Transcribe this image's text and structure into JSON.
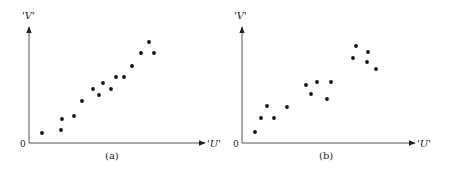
{
  "figure": {
    "panels": [
      {
        "caption": "(a)",
        "x_label": "'U'",
        "y_label": "'V'",
        "origin_label": "0"
      },
      {
        "caption": "(b)",
        "x_label": "'U'",
        "y_label": "'V'",
        "origin_label": "0"
      }
    ]
  },
  "chart_data": [
    {
      "type": "scatter",
      "title": "(a)",
      "xlabel": "'U'",
      "ylabel": "'V'",
      "origin_label": "0",
      "grid": false,
      "ticks": false,
      "description": "Strong linear positive correlation",
      "x_range_px": [
        29,
        205
      ],
      "y_range_px": [
        143,
        26
      ],
      "points": [
        {
          "x": 13,
          "y": 10
        },
        {
          "x": 32,
          "y": 13
        },
        {
          "x": 33,
          "y": 24
        },
        {
          "x": 45,
          "y": 27
        },
        {
          "x": 53,
          "y": 42
        },
        {
          "x": 64,
          "y": 54
        },
        {
          "x": 70,
          "y": 48
        },
        {
          "x": 74,
          "y": 60
        },
        {
          "x": 82,
          "y": 54
        },
        {
          "x": 87,
          "y": 66
        },
        {
          "x": 95,
          "y": 66
        },
        {
          "x": 103,
          "y": 77
        },
        {
          "x": 112,
          "y": 90
        },
        {
          "x": 120,
          "y": 101
        },
        {
          "x": 125,
          "y": 90
        }
      ]
    },
    {
      "type": "scatter",
      "title": "(b)",
      "xlabel": "'U'",
      "ylabel": "'V'",
      "origin_label": "0",
      "grid": false,
      "ticks": false,
      "description": "Positive association in three clusters",
      "x_range_px": [
        242,
        415
      ],
      "y_range_px": [
        143,
        26
      ],
      "points": [
        {
          "x": 13,
          "y": 11
        },
        {
          "x": 19,
          "y": 25
        },
        {
          "x": 25,
          "y": 37
        },
        {
          "x": 32,
          "y": 25
        },
        {
          "x": 45,
          "y": 36
        },
        {
          "x": 64,
          "y": 58
        },
        {
          "x": 69,
          "y": 49
        },
        {
          "x": 75,
          "y": 61
        },
        {
          "x": 85,
          "y": 44
        },
        {
          "x": 89,
          "y": 61
        },
        {
          "x": 111,
          "y": 85
        },
        {
          "x": 114,
          "y": 97
        },
        {
          "x": 125,
          "y": 81
        },
        {
          "x": 126,
          "y": 91
        },
        {
          "x": 134,
          "y": 74
        }
      ]
    }
  ]
}
